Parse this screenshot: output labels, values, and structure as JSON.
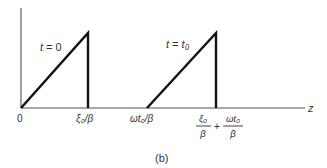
{
  "figure": {
    "caption": "(b)",
    "axis": {
      "z_label": "z",
      "origin_label": "0"
    },
    "pulses": [
      {
        "time_label_prefix": "t = ",
        "time_label_value": "0",
        "start_label": "0",
        "end_label": "ξ₀/β"
      },
      {
        "time_label_prefix": "t = ",
        "time_label_value": "t₀",
        "start_label": "ωt₀/β",
        "end_label_numerator_1": "ξ₀",
        "end_label_denominator_1": "β",
        "end_label_plus": "+",
        "end_label_numerator_2": "ωt₀",
        "end_label_denominator_2": "β"
      }
    ],
    "colors": {
      "axis": "#555555",
      "pulse": "#111111",
      "text": "#333333"
    }
  }
}
